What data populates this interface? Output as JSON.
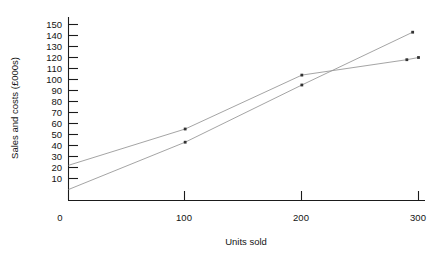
{
  "chart_data": {
    "type": "line",
    "title": "",
    "xlabel": "Units sold",
    "ylabel": "Sales and costs (£000s)",
    "xlim": [
      0,
      300
    ],
    "ylim": [
      0,
      155
    ],
    "grid": false,
    "legend": "none",
    "x_ticks": [
      0,
      100,
      200,
      300
    ],
    "x_tick_labels": [
      "0",
      "100",
      "200",
      "300"
    ],
    "y_ticks": [
      10,
      20,
      30,
      40,
      50,
      60,
      70,
      80,
      90,
      100,
      110,
      120,
      130,
      140,
      150
    ],
    "y_tick_labels": [
      "10",
      "20",
      "30",
      "40",
      "50",
      "60",
      "70",
      "80",
      "90",
      "100",
      "110",
      "120",
      "130",
      "140",
      "150"
    ],
    "series": [
      {
        "name": "Sales revenue",
        "color": "#9a9a9a",
        "x": [
          0,
          100,
          200,
          295
        ],
        "values": [
          0,
          43,
          95,
          143
        ],
        "marker": "dot"
      },
      {
        "name": "Total costs",
        "color": "#9a9a9a",
        "x": [
          0,
          100,
          200,
          290,
          300
        ],
        "values": [
          22,
          55,
          104,
          118,
          120
        ],
        "marker": "dot"
      }
    ],
    "annotations": {
      "break_even_units": 140,
      "break_even_value": 68
    }
  },
  "axis": {
    "y_title": "Sales and costs (£000s)",
    "x_title": "Units sold"
  }
}
